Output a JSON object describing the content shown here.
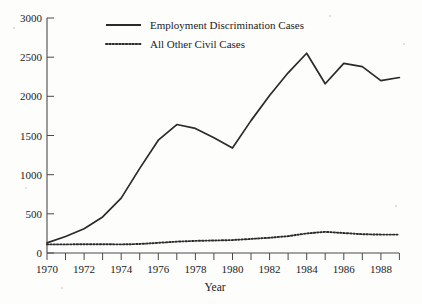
{
  "chart_data": {
    "type": "line",
    "title": "",
    "xlabel": "Year",
    "ylabel": "",
    "xlim": [
      1970,
      1989
    ],
    "ylim": [
      0,
      3000
    ],
    "grid": false,
    "legend_position": "top-center",
    "x": [
      1970,
      1971,
      1972,
      1973,
      1974,
      1975,
      1976,
      1977,
      1978,
      1979,
      1980,
      1981,
      1982,
      1983,
      1984,
      1985,
      1986,
      1987,
      1988,
      1989
    ],
    "x_tick_labels": [
      "1970",
      "1972",
      "1974",
      "1976",
      "1978",
      "1980",
      "1982",
      "1984",
      "1986",
      "1988"
    ],
    "x_tick_values": [
      1970,
      1972,
      1974,
      1976,
      1978,
      1980,
      1982,
      1984,
      1986,
      1988
    ],
    "y_tick_labels": [
      "0",
      "500",
      "1000",
      "1500",
      "2000",
      "2500",
      "3000"
    ],
    "y_tick_values": [
      0,
      500,
      1000,
      1500,
      2000,
      2500,
      3000
    ],
    "series": [
      {
        "name": "Employment Discrimination Cases",
        "style": "solid",
        "values": [
          130,
          210,
          310,
          460,
          700,
          1080,
          1440,
          1640,
          1590,
          1470,
          1340,
          1690,
          2010,
          2300,
          2550,
          2160,
          2420,
          2380,
          2200,
          2240
        ]
      },
      {
        "name": "All Other Civil Cases",
        "style": "dotted",
        "values": [
          110,
          110,
          112,
          112,
          110,
          115,
          130,
          145,
          155,
          160,
          165,
          180,
          195,
          215,
          250,
          270,
          255,
          240,
          235,
          235
        ]
      }
    ]
  },
  "legend": {
    "entries": [
      {
        "label": "Employment Discrimination Cases",
        "style": "solid"
      },
      {
        "label": "All Other Civil Cases",
        "style": "dotted"
      }
    ]
  },
  "axes": {
    "x_title": "Year"
  }
}
